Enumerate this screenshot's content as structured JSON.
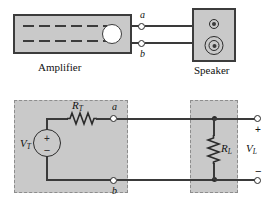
{
  "figure": {
    "colors": {
      "block_fill": "#c9c9c9",
      "block_border": "#3c3c3c",
      "wire": "#3a3a3a",
      "dashed_border": "#8d8d8d",
      "background": "#ffffff"
    }
  },
  "top_diagram": {
    "amplifier": {
      "label": "Amplifier",
      "knob_icon": "round-knob-icon",
      "vent_rows": 2,
      "dashes_per_row": 5
    },
    "speaker": {
      "label": "Speaker",
      "tweeter_icon": "small-speaker-driver-icon",
      "woofer_icon": "large-speaker-driver-icon"
    },
    "terminals": [
      {
        "label": "a",
        "position": "top"
      },
      {
        "label": "b",
        "position": "bottom"
      }
    ]
  },
  "circuit_diagram": {
    "source": {
      "symbol": "voltage-source",
      "label": "V",
      "subscript": "T",
      "plus_sign": "+",
      "minus_sign": "−"
    },
    "series_resistor": {
      "symbol": "resistor",
      "label": "R",
      "subscript": "T"
    },
    "load_resistor": {
      "symbol": "resistor",
      "label": "R",
      "subscript": "L"
    },
    "terminals": [
      {
        "label": "a",
        "position": "top"
      },
      {
        "label": "b",
        "position": "bottom"
      }
    ],
    "output": {
      "voltage_label": "V",
      "voltage_subscript": "L",
      "plus_sign": "+",
      "minus_sign": "−"
    }
  }
}
